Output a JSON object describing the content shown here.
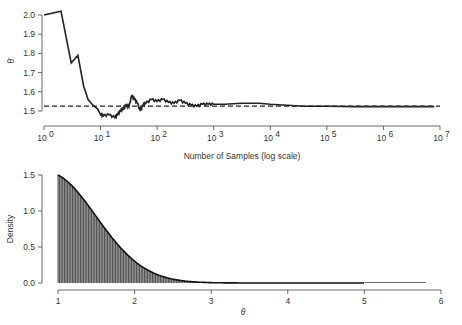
{
  "chart_data": [
    {
      "type": "line",
      "title": "",
      "xlabel": "Number of Samples (log scale)",
      "ylabel": "θ̄",
      "x_scale": "log10",
      "xlim": [
        1,
        10000000
      ],
      "ylim": [
        1.5,
        2.0
      ],
      "x_ticks": [
        "10^0",
        "10^1",
        "10^2",
        "10^3",
        "10^4",
        "10^5",
        "10^6",
        "10^7"
      ],
      "y_ticks": [
        "1.5",
        "1.6",
        "1.7",
        "1.8",
        "1.9",
        "2.0"
      ],
      "grid": false,
      "legend": null,
      "reference_line": {
        "style": "dashed",
        "y": 1.525
      },
      "series": [
        {
          "name": "running mean",
          "x_log10": [
            0,
            0.3,
            0.48,
            0.6,
            0.7,
            0.78,
            0.85,
            0.95,
            1.0,
            1.05,
            1.15,
            1.25,
            1.3,
            1.35,
            1.4,
            1.45,
            1.5,
            1.55,
            1.6,
            1.65,
            1.7,
            1.75,
            1.8,
            1.9,
            2.0,
            2.1,
            2.2,
            2.3,
            2.4,
            2.5,
            2.6,
            2.7,
            2.8,
            2.9,
            3.0,
            3.2,
            3.5,
            3.8,
            4.0,
            4.3,
            4.6,
            5.0,
            5.5,
            6.0,
            6.5,
            6.9
          ],
          "y": [
            2.0,
            2.02,
            1.75,
            1.79,
            1.63,
            1.56,
            1.535,
            1.51,
            1.48,
            1.475,
            1.48,
            1.465,
            1.48,
            1.5,
            1.51,
            1.53,
            1.52,
            1.58,
            1.56,
            1.54,
            1.5,
            1.53,
            1.54,
            1.56,
            1.55,
            1.56,
            1.545,
            1.54,
            1.555,
            1.54,
            1.53,
            1.525,
            1.535,
            1.535,
            1.535,
            1.535,
            1.54,
            1.54,
            1.535,
            1.53,
            1.525,
            1.525,
            1.523,
            1.523,
            1.523,
            1.523
          ]
        }
      ]
    },
    {
      "type": "area",
      "title": "",
      "xlabel": "θ",
      "ylabel": "Density",
      "xlim": [
        1,
        6
      ],
      "ylim": [
        0,
        1.5
      ],
      "x_ticks": [
        "1",
        "2",
        "3",
        "4",
        "5",
        "6"
      ],
      "y_ticks": [
        "0.0",
        "0.5",
        "1.0",
        "1.5"
      ],
      "grid": false,
      "legend": null,
      "fill": "vertical hatching (dark gray)",
      "series": [
        {
          "name": "density",
          "x": [
            1.0,
            1.25,
            1.5,
            1.75,
            2.0,
            2.25,
            2.5,
            2.75,
            3.0,
            3.5,
            4.0,
            4.5,
            5.0,
            5.8
          ],
          "y": [
            1.5,
            1.15,
            0.84,
            0.58,
            0.37,
            0.22,
            0.12,
            0.06,
            0.03,
            0.01,
            0.005,
            0.002,
            0.001,
            0.0
          ]
        }
      ]
    }
  ],
  "top_plot": {
    "ylabel": "θ̄",
    "xlabel": "Number of Samples (log scale)",
    "y_ticks": [
      "1.5",
      "1.6",
      "1.7",
      "1.8",
      "1.9",
      "2.0"
    ],
    "x_ticks_base": [
      "10",
      "10",
      "10",
      "10",
      "10",
      "10",
      "10",
      "10"
    ],
    "x_ticks_exp": [
      "0",
      "1",
      "2",
      "3",
      "4",
      "5",
      "6",
      "7"
    ]
  },
  "bottom_plot": {
    "ylabel": "Density",
    "xlabel": "θ",
    "y_ticks": [
      "0.0",
      "0.5",
      "1.0",
      "1.5"
    ],
    "x_ticks": [
      "1",
      "2",
      "3",
      "4",
      "5",
      "6"
    ]
  }
}
